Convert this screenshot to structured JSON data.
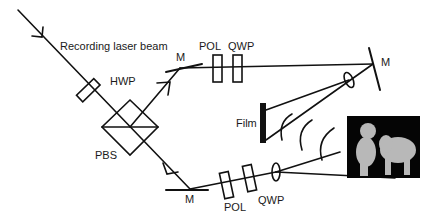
{
  "labels": {
    "beam": "Recording laser beam",
    "hwp": "HWP",
    "pbs": "PBS",
    "mirror_top": "M",
    "mirror_right": "M",
    "mirror_bottom": "M",
    "pol_top": "POL",
    "qwp_top": "QWP",
    "pol_bottom": "POL",
    "qwp_bottom": "QWP",
    "film": "Film"
  },
  "colors": {
    "line": "#111111",
    "background": "#ffffff",
    "object_bg": "#050505",
    "object_fg": "#b8b8b8"
  }
}
